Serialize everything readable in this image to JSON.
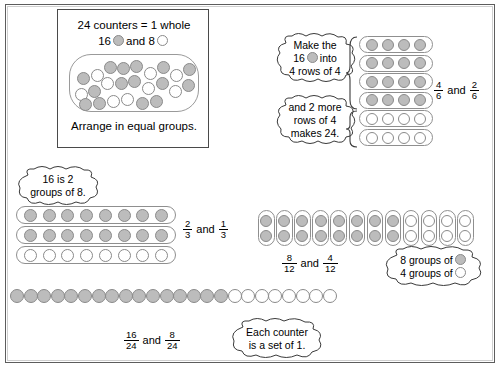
{
  "colors": {
    "gray_counter": "#bcbcbc",
    "white_counter": "#ffffff",
    "counter_outline": "#8a8a8a",
    "frame_border": "#5d5d5d",
    "panel_border": "#4a4a4a"
  },
  "intro_panel": {
    "line1": "24 counters = 1 whole",
    "line2_prefix": "16",
    "line2_middle": "and 8",
    "caption": "Arrange in equal groups.",
    "bag_total": 24,
    "bag_gray": 16,
    "bag_white": 8
  },
  "bubbles": {
    "make_16": {
      "line1": "Make the",
      "line2_prefix": "16",
      "line2_suffix": "into",
      "line3": "4 rows of 4"
    },
    "and_2_more": {
      "line1": "and 2 more",
      "line2": "rows of 4",
      "line3": "makes 24."
    },
    "sixteen_is_2_groups": {
      "line1": "16 is 2",
      "line2": "groups of 8."
    },
    "groups_of": {
      "line1": "8 groups of",
      "line2": "4 groups of"
    },
    "each_counter": {
      "line1": "Each counter",
      "line2": "is a set of 1."
    }
  },
  "groupings": [
    {
      "name": "sixths",
      "rows": 6,
      "per_row": 4,
      "gray_rows": 4,
      "white_rows": 2,
      "label": {
        "left": {
          "numerator": "4",
          "denominator": "6"
        },
        "conjunction": "and",
        "right": {
          "numerator": "2",
          "denominator": "6"
        }
      }
    },
    {
      "name": "thirds",
      "rows": 3,
      "per_row": 8,
      "gray_rows": 2,
      "white_rows": 1,
      "label": {
        "left": {
          "numerator": "2",
          "denominator": "3"
        },
        "conjunction": "and",
        "right": {
          "numerator": "1",
          "denominator": "3"
        }
      }
    },
    {
      "name": "twelfths",
      "columns": 12,
      "per_column": 2,
      "gray_columns": 8,
      "white_columns": 4,
      "label": {
        "left": {
          "numerator": "8",
          "denominator": "12"
        },
        "conjunction": "and",
        "right": {
          "numerator": "4",
          "denominator": "12"
        }
      }
    },
    {
      "name": "twentyfourths",
      "total": 24,
      "gray": 16,
      "white": 8,
      "label": {
        "left": {
          "numerator": "16",
          "denominator": "24"
        },
        "conjunction": "and",
        "right": {
          "numerator": "8",
          "denominator": "24"
        }
      }
    }
  ]
}
